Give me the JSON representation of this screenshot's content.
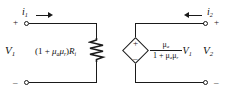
{
  "diagram": {
    "line_color": "#1a1a1a",
    "background": "#ffffff",
    "input_port": {
      "current_label": "i",
      "current_subscript": "1",
      "current_direction": "right",
      "voltage_label": "V",
      "voltage_subscript": "1",
      "top_terminal_sign": "+",
      "bottom_terminal_sign": "–"
    },
    "output_port": {
      "current_label": "i",
      "current_subscript": "2",
      "current_direction": "left",
      "voltage_label": "V",
      "voltage_subscript": "2",
      "top_terminal_sign": "+",
      "bottom_terminal_sign": "–"
    },
    "resistor": {
      "element_type": "resistor",
      "expression_open_paren": "(1 + ",
      "expression_mu_a": "μ",
      "expression_mu_a_sub": "a",
      "expression_mu_r": "μ",
      "expression_mu_r_sub": "r",
      "expression_close_paren": ")",
      "expression_R": "R",
      "expression_R_sub": "i",
      "full_expression": "(1 + μₐμᵣ)Rᵢ"
    },
    "dependent_source": {
      "element_type": "dependent-voltage-source",
      "shape": "diamond",
      "top_sign": "+",
      "bottom_sign": "–",
      "numerator_mu": "μ",
      "numerator_mu_sub": "a",
      "denominator_prefix": "1 + ",
      "denominator_mu_a": "μ",
      "denominator_mu_a_sub": "a",
      "denominator_mu_r": "μ",
      "denominator_mu_r_sub": "r",
      "multiplier_label": "V",
      "multiplier_sub": "1",
      "full_expression": "[μₐ / (1 + μₐμᵣ)] V₁"
    }
  }
}
